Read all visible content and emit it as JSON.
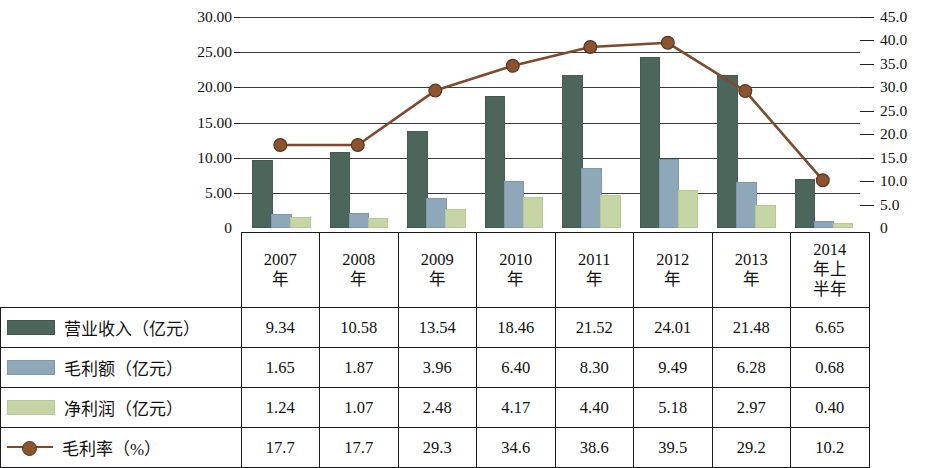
{
  "chart_data": {
    "type": "bar",
    "title": "",
    "subtitle": "",
    "xlabel": "",
    "ylabel": "",
    "categories": [
      "2007年",
      "2008年",
      "2009年",
      "2010年",
      "2011年",
      "2012年",
      "2013年",
      "2014年上半年"
    ],
    "category_lines": [
      [
        "2007",
        "年"
      ],
      [
        "2008",
        "年"
      ],
      [
        "2009",
        "年"
      ],
      [
        "2010",
        "年"
      ],
      [
        "2011",
        "年"
      ],
      [
        "2012",
        "年"
      ],
      [
        "2013",
        "年"
      ],
      [
        "2014",
        "年上",
        "半年"
      ]
    ],
    "series": [
      {
        "name": "营业收入（亿元）",
        "type": "bar",
        "axis": "left",
        "color": "#4d665c",
        "values": [
          9.34,
          10.58,
          13.54,
          18.46,
          21.52,
          24.01,
          21.48,
          6.65
        ]
      },
      {
        "name": "毛利额（亿元）",
        "type": "bar",
        "axis": "left",
        "color": "#8ea8ba",
        "values": [
          1.65,
          1.87,
          3.96,
          6.4,
          8.3,
          9.49,
          6.28,
          0.68
        ]
      },
      {
        "name": "净利润（亿元）",
        "type": "bar",
        "axis": "left",
        "color": "#c6d5a6",
        "values": [
          1.24,
          1.07,
          2.48,
          4.17,
          4.4,
          5.18,
          2.97,
          0.4
        ]
      },
      {
        "name": "毛利率（%）",
        "type": "line",
        "axis": "right",
        "color": "#7d4a2e",
        "values": [
          17.7,
          17.7,
          29.3,
          34.6,
          38.6,
          39.5,
          29.2,
          10.2
        ]
      }
    ],
    "left_axis": {
      "min": 0,
      "max": 30,
      "step": 5,
      "ticks": [
        "0",
        "5.00",
        "10.00",
        "15.00",
        "20.00",
        "25.00",
        "30.00"
      ]
    },
    "right_axis": {
      "min": 0,
      "max": 45,
      "step": 5,
      "ticks": [
        "0",
        "5.0",
        "10.0",
        "15.0",
        "20.0",
        "25.0",
        "30.0",
        "35.0",
        "40.0",
        "45.0"
      ]
    },
    "grid": true,
    "legend_position": "table-below"
  },
  "table": {
    "year_headers": [
      "2007年",
      "2008年",
      "2009年",
      "2010年",
      "2011年",
      "2012年",
      "2013年",
      "2014年上半年"
    ],
    "rows": [
      {
        "label": "营业收入（亿元）",
        "swatch": "rev",
        "values": [
          "9.34",
          "10.58",
          "13.54",
          "18.46",
          "21.52",
          "24.01",
          "21.48",
          "6.65"
        ]
      },
      {
        "label": "毛利额（亿元）",
        "swatch": "gp",
        "values": [
          "1.65",
          "1.87",
          "3.96",
          "6.40",
          "8.30",
          "9.49",
          "6.28",
          "0.68"
        ]
      },
      {
        "label": "净利润（亿元）",
        "swatch": "np",
        "values": [
          "1.24",
          "1.07",
          "2.48",
          "4.17",
          "4.40",
          "5.18",
          "2.97",
          "0.40"
        ]
      },
      {
        "label": "毛利率（%）",
        "swatch": "line",
        "values": [
          "17.7",
          "17.7",
          "29.3",
          "34.6",
          "38.6",
          "39.5",
          "29.2",
          "10.2"
        ]
      }
    ]
  },
  "colors": {
    "revenue": "#4d665c",
    "gross_profit": "#8ea8ba",
    "net_profit": "#c6d5a6",
    "gross_margin_line": "#7d4a2e",
    "marker_fill": "#8a5430",
    "gridline": "#3a3a3a",
    "border": "#1a1a1a"
  }
}
